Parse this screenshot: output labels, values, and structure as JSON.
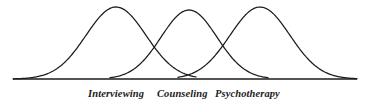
{
  "figure": {
    "name": "continuum-of-helping-relationships",
    "background_color": "#ffffff",
    "line_color": "#1b1b1b",
    "baseline": {
      "y": 79,
      "x_start": 13,
      "x_end": 357
    }
  },
  "chart_data": {
    "type": "line",
    "title": "",
    "subtitle": "",
    "xlabel": "",
    "ylabel": "",
    "grid": false,
    "legend_position": "below-axis",
    "axis": {
      "x_range": [
        13,
        357
      ],
      "y_range": [
        79,
        6
      ],
      "show_x_axis_line": true,
      "show_y_axis_line": false,
      "x_tick_labels": [],
      "y_tick_labels": []
    },
    "annotations": [],
    "series": [
      {
        "name": "Interviewing",
        "peak_x": 116,
        "peak_y": 7,
        "baseline_y": 79,
        "left_foot_x": 13,
        "right_foot_x": 196,
        "sigma": 30,
        "amplitude": 72
      },
      {
        "name": "Counseling",
        "peak_x": 189,
        "peak_y": 10,
        "baseline_y": 79,
        "left_foot_x": 110,
        "right_foot_x": 268,
        "sigma": 28,
        "amplitude": 69
      },
      {
        "name": "Psychotherapy",
        "peak_x": 260,
        "peak_y": 7,
        "baseline_y": 79,
        "left_foot_x": 178,
        "right_foot_x": 357,
        "sigma": 30,
        "amplitude": 72
      }
    ],
    "crossings": [
      {
        "between": [
          "Interviewing",
          "Counseling"
        ],
        "x": 152,
        "y": 34
      },
      {
        "between": [
          "Counseling",
          "Psychotherapy"
        ],
        "x": 224,
        "y": 34
      }
    ]
  },
  "labels": {
    "interviewing": "Interviewing",
    "counseling": "Counseling",
    "psychotherapy": "Psychotherapy"
  }
}
